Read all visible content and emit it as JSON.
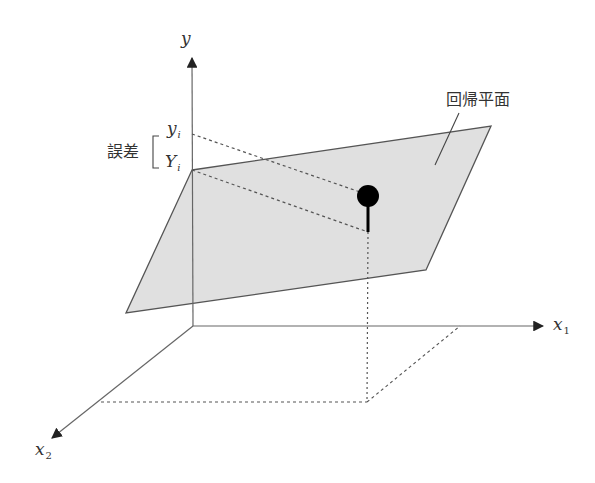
{
  "figure": {
    "colors": {
      "plane_fill": "#e0e0e0",
      "plane_stroke": "#555555",
      "axis": "#666666",
      "dashed": "#555555",
      "point": "#000000"
    }
  },
  "axes": {
    "y_label": "y",
    "x1_label": "x",
    "x1_sub": "1",
    "x2_label": "x",
    "x2_sub": "2"
  },
  "annotations": {
    "observed_label": "y",
    "observed_sub": "i",
    "predicted_label": "Y",
    "predicted_sub": "i",
    "error_label": "誤差",
    "plane_label": "回帰平面"
  },
  "geometry": {
    "origin": [
      193,
      326
    ],
    "y_axis_tip": [
      192,
      56
    ],
    "x1_axis_tip": [
      545,
      326
    ],
    "x2_axis_tip": [
      50,
      440
    ],
    "plane_corners": [
      [
        192,
        170
      ],
      [
        491,
        126
      ],
      [
        426,
        270
      ],
      [
        126,
        313
      ]
    ],
    "data_point": [
      368,
      196
    ],
    "projection_on_plane": [
      368,
      232
    ],
    "foot_point": [
      367,
      402
    ],
    "x1_foot": [
      460,
      326
    ],
    "x2_foot": [
      101,
      402
    ]
  }
}
